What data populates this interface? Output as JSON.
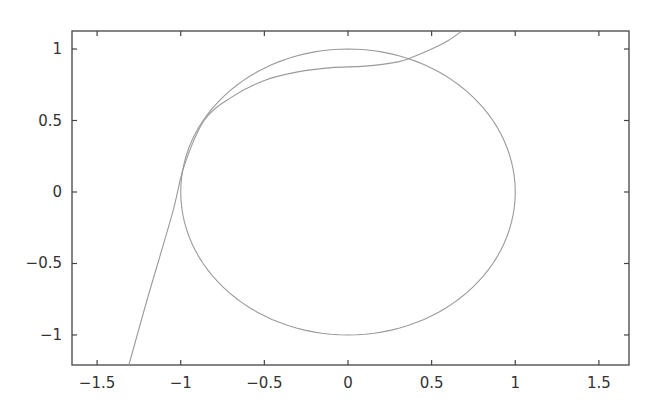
{
  "chart_data": {
    "type": "line",
    "title": "",
    "xlabel": "",
    "ylabel": "",
    "xlim": [
      -1.65,
      1.68
    ],
    "ylim": [
      -1.21,
      1.126
    ],
    "grid": false,
    "legend": null,
    "x_ticks": [
      -1.5,
      -1,
      -0.5,
      0,
      0.5,
      1,
      1.5
    ],
    "x_tick_labels": [
      "−1.5",
      "−1",
      "−0.5",
      "0",
      "0.5",
      "1",
      "1.5"
    ],
    "y_ticks": [
      1,
      0.5,
      0,
      -0.5,
      -1
    ],
    "y_tick_labels": [
      "1",
      "0.5",
      "0",
      "−0.5",
      "−1"
    ],
    "series": [
      {
        "name": "unit circle",
        "equation": "x^2 + y^2 = 1",
        "color": "#9a9a9a",
        "x": [
          1,
          0.866,
          0.5,
          0,
          -0.5,
          -0.866,
          -1,
          -0.866,
          -0.5,
          0,
          0.5,
          0.866,
          1
        ],
        "y": [
          0,
          0.5,
          0.866,
          1,
          0.866,
          0.5,
          0,
          -0.5,
          -0.866,
          -1,
          -0.866,
          -0.5,
          0
        ]
      },
      {
        "name": "curve",
        "color": "#9a9a9a",
        "x": [
          -1.31,
          -1.2,
          -1.05,
          -0.98,
          -0.86,
          -0.7,
          -0.5,
          -0.3,
          -0.1,
          0.1,
          0.3,
          0.38,
          0.5,
          0.6,
          0.68
        ],
        "y": [
          -1.21,
          -0.75,
          -0.15,
          0.18,
          0.5,
          0.66,
          0.78,
          0.84,
          0.87,
          0.88,
          0.91,
          0.94,
          1.0,
          1.06,
          1.126
        ]
      }
    ]
  }
}
